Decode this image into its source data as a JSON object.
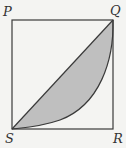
{
  "diagram": {
    "type": "geometry",
    "shape": "square",
    "vertices": {
      "P": {
        "label": "P",
        "x": 12,
        "y": 20
      },
      "Q": {
        "label": "Q",
        "x": 113,
        "y": 20
      },
      "R": {
        "label": "R",
        "x": 113,
        "y": 129
      },
      "S": {
        "label": "S",
        "x": 12,
        "y": 129
      }
    },
    "shaded_region": "between diagonal SQ and arc SQ curving toward R",
    "colors": {
      "background": "#f4f4f2",
      "stroke": "#3a3a3a",
      "shade": "#bfbfbf",
      "label": "#333333"
    }
  }
}
